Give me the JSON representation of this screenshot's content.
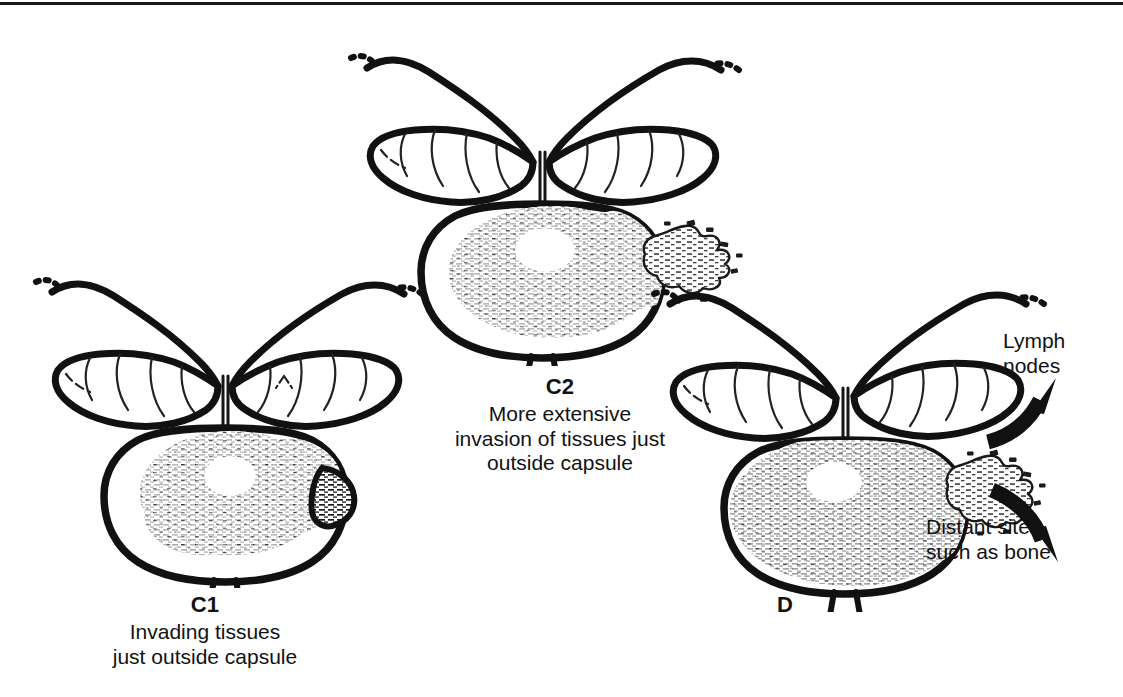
{
  "figure": {
    "background_color": "#ffffff",
    "ink_color": "#111111",
    "border": {
      "position": "top",
      "color": "#1a1a1a"
    }
  },
  "panels": [
    {
      "id": "c1",
      "stage_label": "C1",
      "caption_lines": [
        "Invading tissues",
        "just outside capsule"
      ],
      "anatomy": {
        "organ": "prostate-gland",
        "parts": [
          "vas-deferens",
          "seminal-vesicle-left",
          "seminal-vesicle-right",
          "prostate-capsule",
          "urethra"
        ],
        "tumor": {
          "name": "tumor-shading",
          "extent": "small-focus-bulging-capsule",
          "side": "right"
        }
      }
    },
    {
      "id": "c2",
      "stage_label": "C2",
      "caption_lines": [
        "More extensive",
        "invasion of tissues just",
        "outside capsule"
      ],
      "anatomy": {
        "organ": "prostate-gland",
        "parts": [
          "vas-deferens",
          "seminal-vesicle-left",
          "seminal-vesicle-right",
          "prostate-capsule",
          "urethra"
        ],
        "tumor": {
          "name": "tumor-shading",
          "extent": "breaching-capsule-ragged-extension",
          "side": "right"
        }
      }
    },
    {
      "id": "d",
      "stage_label": "D",
      "caption_lines": [],
      "anatomy": {
        "organ": "prostate-gland",
        "parts": [
          "vas-deferens",
          "seminal-vesicle-left",
          "seminal-vesicle-right",
          "prostate-capsule",
          "urethra"
        ],
        "tumor": {
          "name": "tumor-shading",
          "extent": "extensive-filling-gland-with-spread",
          "side": "right"
        }
      },
      "annotations": [
        {
          "id": "lymph-nodes",
          "lines": [
            "Lymph",
            "nodes"
          ],
          "arrow": "curved-arrow-up-right"
        },
        {
          "id": "distant-sites",
          "lines": [
            "Distant sites,",
            "such as bone"
          ],
          "arrow": "curved-arrow-down-right"
        }
      ]
    }
  ]
}
